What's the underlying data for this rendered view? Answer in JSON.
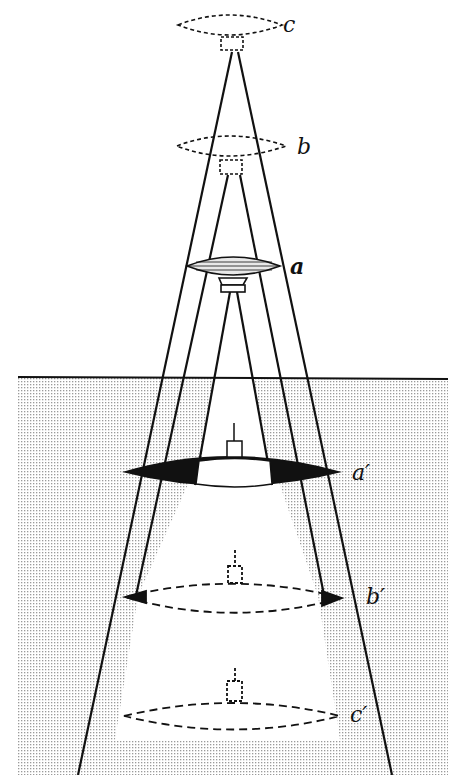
{
  "figure": {
    "labels": {
      "c": "c",
      "b": "b",
      "a": "a",
      "a_prime": "a′",
      "b_prime": "b′",
      "c_prime": "c′"
    },
    "colors": {
      "ink": "#111111",
      "water": "#d9d9d9",
      "background": "#ffffff"
    }
  }
}
